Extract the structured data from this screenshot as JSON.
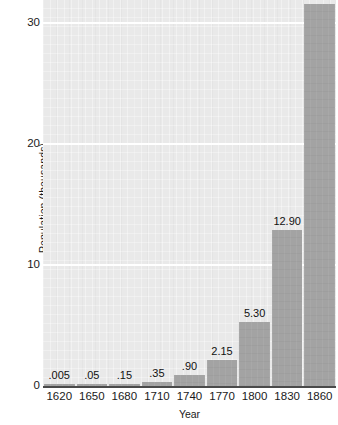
{
  "chart_data": {
    "type": "bar",
    "title": "",
    "xlabel": "Year",
    "ylabel": "Population (thousands)",
    "categories": [
      "1620",
      "1650",
      "1680",
      "1710",
      "1740",
      "1770",
      "1800",
      "1830",
      "1860"
    ],
    "values": [
      0.005,
      0.05,
      0.15,
      0.35,
      0.9,
      2.15,
      5.3,
      12.9,
      31.5
    ],
    "value_labels": [
      ".005",
      ".05",
      ".15",
      ".35",
      ".90",
      "2.15",
      "5.30",
      "12.90",
      "31.50"
    ],
    "ylim": [
      0,
      31.5
    ],
    "y_ticks": [
      0,
      10,
      20,
      30
    ],
    "y_tick_labels": [
      "0",
      "10",
      "20",
      "30"
    ],
    "grid": "horizontal-white-gridlines-at-10-20-30",
    "legend": "none",
    "colors": {
      "bar": "#a3a3a3",
      "plot_background": "#e9e9e9",
      "gridline": "#ffffff",
      "axis": "#4a4a4a",
      "text": "#1a1a1a",
      "page_background": "#ffffff"
    }
  }
}
